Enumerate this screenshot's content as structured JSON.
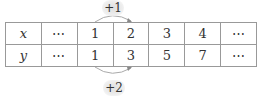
{
  "table": {
    "rows": [
      {
        "label": "x",
        "cells": [
          "⋯",
          "1",
          "2",
          "3",
          "4",
          "⋯"
        ]
      },
      {
        "label": "y",
        "cells": [
          "⋯",
          "1",
          "3",
          "5",
          "7",
          "⋯"
        ]
      }
    ]
  },
  "annotations": {
    "top": "+1",
    "bottom": "+2"
  }
}
